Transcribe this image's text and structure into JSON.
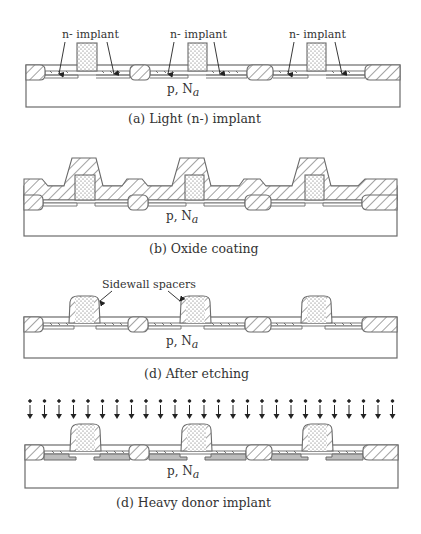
{
  "figure": {
    "substrate_label": "p, N",
    "substrate_subscript": "a",
    "panels": [
      {
        "id": "a",
        "caption": "(a)  Light (n-) implant",
        "annotation": "n- implant"
      },
      {
        "id": "b",
        "caption": "(b)  Oxide coating"
      },
      {
        "id": "c",
        "caption": "(d)  After etching",
        "annotation": "Sidewall spacers"
      },
      {
        "id": "d",
        "caption": "(d)  Heavy donor implant"
      }
    ]
  },
  "colors": {
    "line": "#6b6b6b",
    "text": "#333333",
    "background": "#ffffff"
  }
}
